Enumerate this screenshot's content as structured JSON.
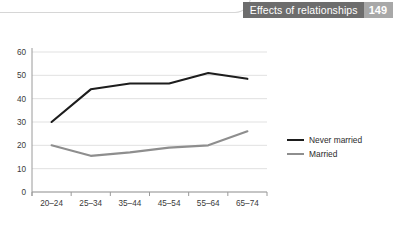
{
  "header": {
    "title": "Effects of relationships",
    "page_number": "149",
    "title_band_color": "#6d6d6d",
    "page_band_color": "#a8a8a8"
  },
  "legend": {
    "position": "right",
    "items": [
      {
        "label": "Never married",
        "color": "#1d1d1d",
        "icon": "line-swatch-icon"
      },
      {
        "label": "Married",
        "color": "#8e8e8e",
        "icon": "line-swatch-icon"
      }
    ]
  },
  "chart_data": {
    "type": "line",
    "title": "",
    "subtitle": "",
    "xlabel": "",
    "ylabel": "",
    "categories": [
      "20–24",
      "25–34",
      "35–44",
      "45–54",
      "55–64",
      "65–74"
    ],
    "ylim": [
      0,
      60
    ],
    "yticks": [
      0,
      10,
      20,
      30,
      40,
      50,
      60
    ],
    "ytick_labels": [
      "0",
      "10",
      "20",
      "30",
      "40",
      "50",
      "60"
    ],
    "grid": true,
    "grid_axis": "y",
    "legend_position": "right",
    "series": [
      {
        "name": "Never married",
        "color": "#1d1d1d",
        "values": [
          30,
          44,
          46.5,
          46.5,
          51,
          48.5
        ]
      },
      {
        "name": "Married",
        "color": "#8e8e8e",
        "values": [
          20,
          15.5,
          17,
          19,
          20,
          26
        ]
      }
    ]
  }
}
